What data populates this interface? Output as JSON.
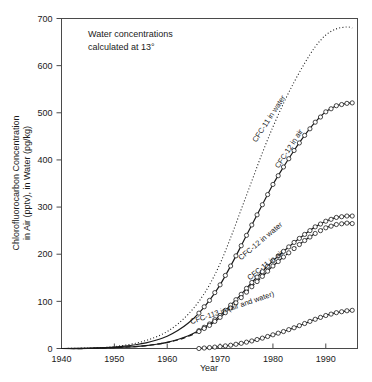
{
  "chart_data": {
    "type": "line",
    "title": "",
    "xlabel": "Year",
    "ylabel": "Chlorofluorocarbon Concentration in Air (pptv), in Water (pg/kg)",
    "ylabel_line1": "Chlorofluorocarbon Concentration",
    "ylabel_line2": "in Air (pptv), in Water (pg/kg)",
    "xlim": [
      1940,
      1996
    ],
    "ylim": [
      0,
      700
    ],
    "xticks": [
      1940,
      1950,
      1960,
      1970,
      1980,
      1990
    ],
    "yticks": [
      0,
      100,
      200,
      300,
      400,
      500,
      600,
      700
    ],
    "grid": false,
    "legend": "inline-curve-labels",
    "annotations": [
      {
        "name": "water-concentration-note",
        "line1": "Water concentrations",
        "line2": "calculated at 13°",
        "text": "Water concentrations calculated at 13°"
      }
    ],
    "series": [
      {
        "name": "CFC-11 in water",
        "label": "CFC-11 in water",
        "style": "dotted",
        "marker": "none",
        "x": [
          1940,
          1945,
          1948,
          1950,
          1952,
          1954,
          1956,
          1958,
          1960,
          1962,
          1964,
          1966,
          1968,
          1970,
          1972,
          1974,
          1976,
          1978,
          1980,
          1982,
          1984,
          1986,
          1988,
          1990,
          1992,
          1994,
          1995
        ],
        "values": [
          0,
          1,
          2,
          4,
          7,
          11,
          17,
          25,
          36,
          52,
          73,
          100,
          135,
          180,
          235,
          295,
          355,
          415,
          470,
          520,
          565,
          605,
          640,
          665,
          678,
          682,
          680
        ]
      },
      {
        "name": "CFC-12 in air",
        "label": "CFC-12 in air",
        "style": "solid",
        "marker": "circle",
        "x": [
          1940,
          1945,
          1948,
          1950,
          1952,
          1954,
          1956,
          1958,
          1960,
          1962,
          1964,
          1966,
          1968,
          1970,
          1972,
          1974,
          1976,
          1978,
          1980,
          1982,
          1984,
          1986,
          1988,
          1990,
          1992,
          1994,
          1995
        ],
        "values": [
          0,
          1,
          2,
          3,
          5,
          8,
          12,
          18,
          26,
          38,
          54,
          75,
          102,
          135,
          175,
          218,
          262,
          305,
          348,
          385,
          420,
          452,
          480,
          502,
          515,
          520,
          521
        ]
      },
      {
        "name": "CFC-12 in water",
        "label": "CFC-12 in water",
        "style": "solid",
        "marker": "circle",
        "x": [
          1940,
          1945,
          1948,
          1950,
          1952,
          1954,
          1956,
          1958,
          1960,
          1962,
          1964,
          1966,
          1968,
          1970,
          1972,
          1974,
          1976,
          1978,
          1980,
          1982,
          1984,
          1986,
          1988,
          1990,
          1992,
          1994,
          1995
        ],
        "values": [
          0,
          0,
          1,
          2,
          3,
          4,
          6,
          9,
          13,
          19,
          27,
          38,
          52,
          70,
          92,
          115,
          140,
          163,
          186,
          206,
          225,
          242,
          258,
          270,
          278,
          281,
          281
        ]
      },
      {
        "name": "CFC-11 in air",
        "label": "CFC-11 in air",
        "style": "dashed",
        "marker": "circle",
        "x": [
          1940,
          1945,
          1948,
          1950,
          1952,
          1954,
          1956,
          1958,
          1960,
          1962,
          1964,
          1966,
          1968,
          1970,
          1972,
          1974,
          1976,
          1978,
          1980,
          1982,
          1984,
          1986,
          1988,
          1990,
          1992,
          1994,
          1995
        ],
        "values": [
          0,
          0,
          1,
          2,
          3,
          4,
          6,
          9,
          13,
          18,
          26,
          36,
          49,
          66,
          86,
          108,
          131,
          153,
          175,
          194,
          212,
          229,
          244,
          256,
          263,
          266,
          265
        ]
      },
      {
        "name": "CFC-113 in (air and water)",
        "label": "CFC-113 in (air and water)",
        "style": "solid",
        "marker": "circle",
        "x": [
          1966,
          1968,
          1970,
          1972,
          1974,
          1976,
          1978,
          1980,
          1982,
          1984,
          1986,
          1988,
          1990,
          1992,
          1994,
          1995
        ],
        "values": [
          0,
          2,
          4,
          7,
          11,
          16,
          22,
          29,
          36,
          44,
          53,
          62,
          70,
          76,
          80,
          81
        ]
      }
    ]
  },
  "colors": {
    "axis": "#4a4a4a",
    "curve": "#1a1a1a",
    "background": "#ffffff"
  }
}
